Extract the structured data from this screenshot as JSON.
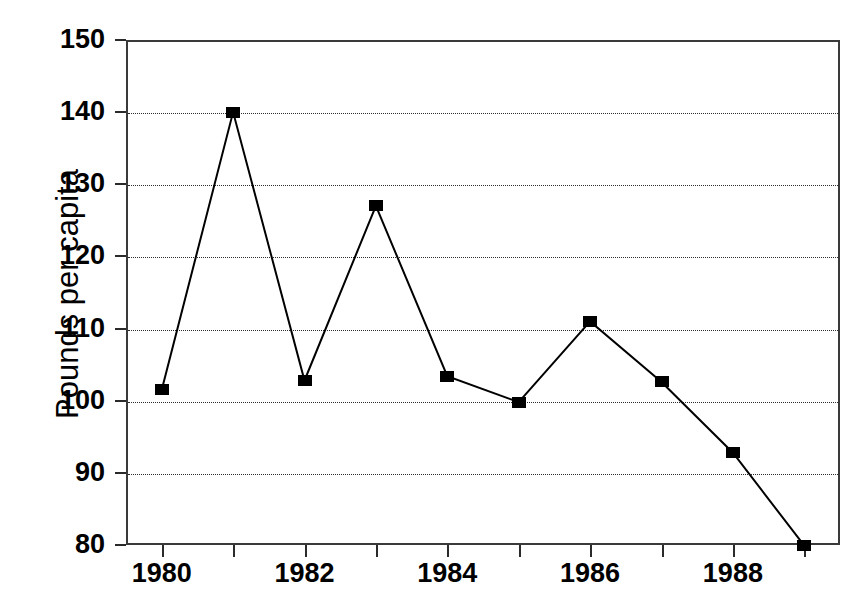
{
  "chart_data": {
    "type": "line",
    "title": "",
    "subtitle": "",
    "xlabel": "",
    "ylabel": "Pounds per capita",
    "x": [
      1980,
      1981,
      1982,
      1983,
      1984,
      1985,
      1986,
      1987,
      1988,
      1989
    ],
    "values": [
      101.5,
      140.0,
      102.8,
      127.0,
      103.4,
      99.8,
      111.0,
      102.6,
      92.8,
      79.9
    ],
    "series": [
      {
        "name": "Pounds per capita",
        "values": [
          101.5,
          140.0,
          102.8,
          127.0,
          103.4,
          99.8,
          111.0,
          102.6,
          92.8,
          79.9
        ]
      }
    ],
    "xlim": [
      1979.5,
      1989.5
    ],
    "ylim": [
      80,
      150
    ],
    "ytick_labels": [
      "150",
      "140",
      "130",
      "120",
      "110",
      "100",
      "90",
      "80"
    ],
    "ytick_values": [
      150,
      140,
      130,
      120,
      110,
      100,
      90,
      80
    ],
    "xtick_values": [
      1980,
      1981,
      1982,
      1983,
      1984,
      1985,
      1986,
      1987,
      1988,
      1989
    ],
    "xtick_labels": [
      "1980",
      "",
      "1982",
      "",
      "1984",
      "",
      "1986",
      "",
      "1988",
      ""
    ],
    "grid": "horizontal-dotted",
    "legend": "none",
    "marker": "filled-square",
    "line_color": "#000000",
    "marker_color": "#000000",
    "grid_color": "#2b2b2b",
    "axis_color": "#3a3a3a",
    "background": "#ffffff"
  }
}
